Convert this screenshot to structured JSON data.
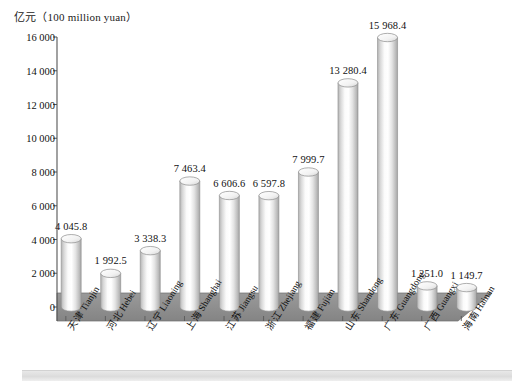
{
  "chart_data": {
    "type": "bar",
    "title": "亿元（100 million yuan）",
    "xlabel": "",
    "ylabel": "亿元（100 million yuan）",
    "ylim": [
      0,
      16000
    ],
    "ytick_step": 2000,
    "grid": false,
    "legend": "none",
    "style": "3d-cylinder",
    "categories": [
      "天津 Tianjin",
      "河北 Hebei",
      "辽宁 Liaoning",
      "上海 Shanghai",
      "江苏 Jiangsu",
      "浙江 Zhejiang",
      "福建 Fujian",
      "山东 Shandong",
      "广东 Guangdong",
      "广西 Guangxi",
      "海南 Hainan"
    ],
    "values": [
      4045.8,
      1992.5,
      3338.3,
      7463.4,
      6606.6,
      6597.8,
      7999.7,
      13280.4,
      15968.4,
      1251.0,
      1149.7
    ],
    "value_labels": [
      "4 045.8",
      "1 992.5",
      "3 338.3",
      "7 463.4",
      "6 606.6",
      "6 597.8",
      "7 999.7",
      "13 280.4",
      "15 968.4",
      "1 251.0",
      "1 149.7"
    ],
    "ytick_labels": [
      "0",
      "2 000",
      "4 000",
      "6 000",
      "8 000",
      "10 000",
      "12 000",
      "14 000",
      "16 000"
    ],
    "ytick_values": [
      0,
      2000,
      4000,
      6000,
      8000,
      10000,
      12000,
      14000,
      16000
    ],
    "colors": {
      "floor": "#8f8f8f",
      "floor_side": "#7a7a7a",
      "bar_light": "#ffffff",
      "bar_mid": "#e6e6e6",
      "bar_dark": "#a9a9a9",
      "axis": "#555555",
      "text": "#111111",
      "background": "#ffffff"
    }
  }
}
